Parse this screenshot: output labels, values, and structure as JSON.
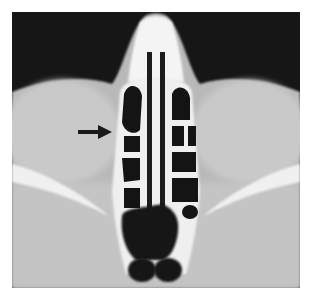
{
  "figure": {
    "type": "axial CT scan of paranasal sinuses",
    "annotation": {
      "marker": "arrow-right",
      "color": "#1a1a1a"
    },
    "colors": {
      "background": "#ffffff",
      "air": "#141414",
      "soft_tissue": "#bdbdbd",
      "orbit": "#c8c8c8",
      "bone": "#f2f2f2"
    }
  }
}
